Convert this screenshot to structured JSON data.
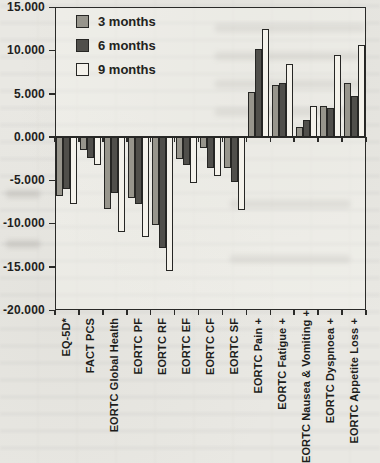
{
  "chart_data": {
    "type": "bar",
    "title": "",
    "xlabel": "",
    "ylabel": "",
    "ylim": [
      -20,
      15
    ],
    "ytick_step": 5,
    "ytick_labels": [
      "15.000",
      "10.000",
      "5.000",
      "0.000",
      "-5.000",
      "-10.000",
      "-15.000",
      "-20.000"
    ],
    "ytick_values": [
      15,
      10,
      5,
      0,
      -5,
      -10,
      -15,
      -20
    ],
    "grid": false,
    "baseline": 0,
    "legend_position": "top-left-inside",
    "categories": [
      "EQ-5D*",
      "FACT PCS",
      "EORTC Global Health",
      "EORTC PF",
      "EORTC RF",
      "EORTC EF",
      "EORTC CF",
      "EORTC SF",
      "EORTC Pain +",
      "EORTC Fatigue +",
      "EORTC Nausea & Vomiting +",
      "EORTC Dyspnoea +",
      "EORTC Appetite Loss +"
    ],
    "series": [
      {
        "name": "3 months",
        "color": "#97958c",
        "values": [
          -6.8,
          -1.5,
          -8.3,
          -7.1,
          -10.2,
          -2.6,
          -1.3,
          -3.6,
          5.2,
          6.0,
          1.1,
          3.6,
          6.2
        ]
      },
      {
        "name": "6 months",
        "color": "#504f4b",
        "values": [
          -6.0,
          -2.4,
          -6.5,
          -7.8,
          -12.8,
          -3.2,
          -3.6,
          -5.2,
          10.1,
          6.2,
          2.0,
          3.3,
          4.7
        ]
      },
      {
        "name": "9 months",
        "color": "#f4f2eb",
        "values": [
          -7.8,
          -3.2,
          -11.0,
          -11.6,
          -15.5,
          -5.3,
          -4.5,
          -8.4,
          12.5,
          8.4,
          3.6,
          9.4,
          10.6
        ]
      }
    ]
  }
}
